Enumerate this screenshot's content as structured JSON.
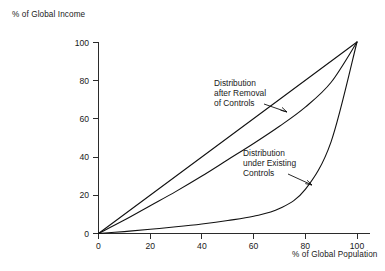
{
  "chart_data": {
    "type": "line",
    "title": "",
    "xlabel": "% of Global Population",
    "ylabel": "% of Global Income",
    "xlim": [
      0,
      100
    ],
    "ylim": [
      0,
      100
    ],
    "grid": false,
    "legend": "inline-annotations",
    "xticks": [
      "0",
      "20",
      "40",
      "60",
      "80",
      "100"
    ],
    "yticks": [
      "0",
      "20",
      "40",
      "60",
      "80",
      "100"
    ],
    "xtick_values": [
      0,
      20,
      40,
      60,
      80,
      100
    ],
    "ytick_values": [
      0,
      20,
      40,
      60,
      80,
      100
    ],
    "x": [
      0,
      10,
      20,
      30,
      40,
      50,
      60,
      70,
      80,
      90,
      100
    ],
    "series": [
      {
        "name": "Line of Equality",
        "values": [
          0,
          10,
          20,
          30,
          40,
          50,
          60,
          70,
          80,
          90,
          100
        ]
      },
      {
        "name": "Distribution after Removal of Controls",
        "values": [
          0,
          7,
          14.5,
          22,
          30,
          38.5,
          47,
          56,
          66,
          79,
          100
        ]
      },
      {
        "name": "Distribution under Existing Controls",
        "values": [
          0,
          1,
          2.2,
          3.5,
          5,
          6.8,
          9,
          13,
          23,
          48,
          100
        ]
      }
    ],
    "annotations": [
      {
        "id": "annotation-removal",
        "lines": [
          "Distribution",
          "after Removal",
          "of Controls"
        ],
        "points_to": {
          "x": 78,
          "y": 62
        }
      },
      {
        "id": "annotation-existing",
        "lines": [
          "Distribution",
          "under Existing",
          "Controls"
        ],
        "points_to": {
          "x": 82,
          "y": 26
        }
      }
    ],
    "colors": {
      "line": "#111111",
      "axis": "#2b2b2b",
      "background": "#ffffff",
      "text": "#1a1a1a"
    }
  }
}
